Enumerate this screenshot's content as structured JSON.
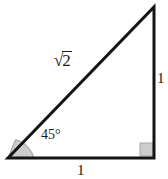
{
  "figure": {
    "name": "right-isosceles-triangle-45-45-90",
    "background_color": "#ffffff",
    "stroke_color": "#141414",
    "fill_color": "#cccccc",
    "fill_stroke_color": "#9a9a9a",
    "stroke_width": 3,
    "vertices": {
      "bottom_left": [
        8,
        158
      ],
      "bottom_right": [
        154,
        158
      ],
      "apex": [
        154,
        7
      ]
    },
    "labels": {
      "hypotenuse": {
        "radical_sign": "√",
        "radicand": "2",
        "full_text": "√2"
      },
      "angle": "45°",
      "vertical_side": "1",
      "base_side": "1"
    },
    "markers": {
      "angle_arc": {
        "name": "angle-arc-45",
        "center": [
          8,
          158
        ],
        "radius": 26,
        "start_deg": 0,
        "end_deg": 45,
        "fill": "#cccccc"
      },
      "right_angle_square": {
        "name": "right-angle-marker",
        "x": 140,
        "y": 143,
        "size": 13,
        "fill": "#cccccc"
      }
    }
  }
}
